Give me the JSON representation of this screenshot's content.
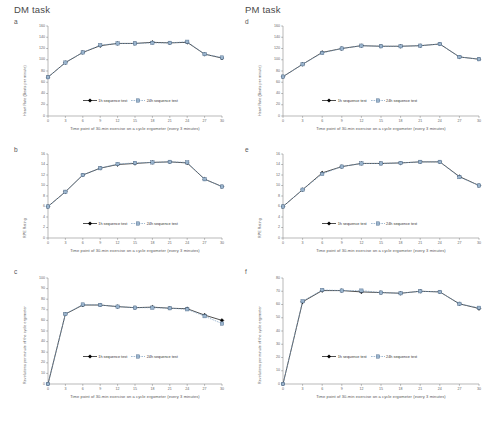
{
  "figure": {
    "columns": [
      {
        "title": "DM task",
        "id": "dm"
      },
      {
        "title": "PM task",
        "id": "pm"
      }
    ],
    "legend": {
      "series1": "1h sequence test",
      "series2": "24h sequence test",
      "color1": "#000000",
      "color2": "#7d9fc0"
    },
    "xlabel": "Time point of 30-min exercise on a cycle ergometer (every 3 minutes)"
  },
  "chart_data": [
    {
      "type": "line",
      "panel": "a",
      "column": "DM task",
      "title": "",
      "xlabel": "Time point of 30-min exercise on a cycle ergometer (every 3 minutes)",
      "ylabel": "Heart Rate (Beats per minute)",
      "x": [
        0,
        3,
        6,
        9,
        12,
        15,
        18,
        21,
        24,
        27,
        30
      ],
      "xticks": [
        0,
        3,
        6,
        9,
        12,
        15,
        18,
        21,
        24,
        27,
        30
      ],
      "yticks": [
        0,
        20,
        40,
        60,
        80,
        100,
        120,
        140,
        160
      ],
      "ylim": [
        0,
        160
      ],
      "xlim": [
        0,
        30
      ],
      "grid": false,
      "legend_position": "lower-center",
      "series": [
        {
          "name": "1h sequence test",
          "values": [
            69,
            95,
            113,
            125,
            129,
            129,
            131,
            130,
            131,
            110,
            103
          ]
        },
        {
          "name": "24h sequence test",
          "values": [
            69,
            95,
            113,
            126,
            129,
            129,
            130,
            130,
            132,
            110,
            104
          ]
        }
      ]
    },
    {
      "type": "line",
      "panel": "b",
      "column": "DM task",
      "title": "",
      "xlabel": "Time point of 30-min exercise on a cycle ergometer (every 3 minutes)",
      "ylabel": "RPE Rating",
      "x": [
        0,
        3,
        6,
        9,
        12,
        15,
        18,
        21,
        24,
        27,
        30
      ],
      "xticks": [
        0,
        3,
        6,
        9,
        12,
        15,
        18,
        21,
        24,
        27,
        30
      ],
      "yticks": [
        0,
        2,
        4,
        6,
        8,
        10,
        12,
        14,
        16
      ],
      "ylim": [
        0,
        16
      ],
      "xlim": [
        0,
        30
      ],
      "grid": false,
      "legend_position": "lower-center",
      "series": [
        {
          "name": "1h sequence test",
          "values": [
            6.0,
            8.8,
            12.0,
            13.3,
            14.0,
            14.2,
            14.4,
            14.5,
            14.3,
            11.2,
            9.8
          ]
        },
        {
          "name": "24h sequence test",
          "values": [
            6.0,
            8.8,
            12.0,
            13.3,
            14.1,
            14.3,
            14.4,
            14.5,
            14.4,
            11.2,
            9.8
          ]
        }
      ]
    },
    {
      "type": "line",
      "panel": "c",
      "column": "DM task",
      "title": "",
      "xlabel": "Time point of 30-min exercise on a cycle ergometer (every 3 minutes)",
      "ylabel": "Revolutions per minute of the cycle ergometer",
      "x": [
        0,
        3,
        6,
        9,
        12,
        15,
        18,
        21,
        24,
        27,
        30
      ],
      "xticks": [
        0,
        3,
        6,
        9,
        12,
        15,
        18,
        21,
        24,
        27,
        30
      ],
      "yticks": [
        0,
        10,
        20,
        30,
        40,
        50,
        60,
        70,
        80,
        90,
        100
      ],
      "ylim": [
        0,
        100
      ],
      "xlim": [
        0,
        30
      ],
      "grid": false,
      "legend_position": "lower-center",
      "series": [
        {
          "name": "1h sequence test",
          "values": [
            0,
            66,
            74.5,
            74.5,
            73,
            72,
            72.5,
            71.5,
            71,
            65,
            60
          ]
        },
        {
          "name": "24h sequence test",
          "values": [
            0,
            66,
            75,
            74.5,
            73,
            72,
            72,
            71.5,
            70.5,
            64,
            57
          ]
        }
      ]
    },
    {
      "type": "line",
      "panel": "d",
      "column": "PM task",
      "title": "",
      "xlabel": "Time point of 30-min exercise on a cycle ergometer (every 3 minutes)",
      "ylabel": "Heart Rate (Beats per minute)",
      "x": [
        0,
        3,
        6,
        9,
        12,
        15,
        18,
        21,
        24,
        27,
        30
      ],
      "xticks": [
        0,
        3,
        6,
        9,
        12,
        15,
        18,
        21,
        24,
        27,
        30
      ],
      "yticks": [
        0,
        20,
        40,
        60,
        80,
        100,
        120,
        140,
        160
      ],
      "ylim": [
        0,
        160
      ],
      "xlim": [
        0,
        30
      ],
      "grid": false,
      "legend_position": "lower-center",
      "series": [
        {
          "name": "1h sequence test",
          "values": [
            70,
            92,
            113,
            120,
            125,
            124,
            124,
            125,
            128,
            105,
            101
          ]
        },
        {
          "name": "24h sequence test",
          "values": [
            70,
            92,
            112,
            120,
            125,
            124,
            124,
            125,
            128,
            105,
            101
          ]
        }
      ]
    },
    {
      "type": "line",
      "panel": "e",
      "column": "PM task",
      "title": "",
      "xlabel": "Time point of 30-min exercise on a cycle ergometer (every 3 minutes)",
      "ylabel": "RPE Rating",
      "x": [
        0,
        3,
        6,
        9,
        12,
        15,
        18,
        21,
        24,
        27,
        30
      ],
      "xticks": [
        0,
        3,
        6,
        9,
        12,
        15,
        18,
        21,
        24,
        27,
        30
      ],
      "yticks": [
        0,
        2,
        4,
        6,
        8,
        10,
        12,
        14,
        16
      ],
      "ylim": [
        0,
        16
      ],
      "xlim": [
        0,
        30
      ],
      "grid": false,
      "legend_position": "lower-center",
      "series": [
        {
          "name": "1h sequence test",
          "values": [
            6.0,
            9.2,
            12.4,
            13.6,
            14.2,
            14.2,
            14.3,
            14.5,
            14.5,
            11.7,
            10.0
          ]
        },
        {
          "name": "24h sequence test",
          "values": [
            6.0,
            9.2,
            12.2,
            13.6,
            14.2,
            14.2,
            14.3,
            14.5,
            14.5,
            11.6,
            10.0
          ]
        }
      ]
    },
    {
      "type": "line",
      "panel": "f",
      "column": "PM task",
      "title": "",
      "xlabel": "Time point of 30-min exercise on a cycle ergometer (every 3 minutes)",
      "ylabel": "Revolutions per minute of the cycle ergometer",
      "x": [
        0,
        3,
        6,
        9,
        12,
        15,
        18,
        21,
        24,
        27,
        30
      ],
      "xticks": [
        0,
        3,
        6,
        9,
        12,
        15,
        18,
        21,
        24,
        27,
        30
      ],
      "yticks": [
        0,
        10,
        20,
        30,
        40,
        50,
        60,
        70,
        80
      ],
      "ylim": [
        0,
        80
      ],
      "xlim": [
        0,
        30
      ],
      "grid": false,
      "legend_position": "lower-center",
      "series": [
        {
          "name": "1h sequence test",
          "values": [
            0,
            62,
            70.5,
            70.5,
            69.5,
            69,
            68.5,
            70,
            69.5,
            60.5,
            57
          ]
        },
        {
          "name": "24h sequence test",
          "values": [
            0,
            62.5,
            71,
            70.5,
            70.5,
            69,
            68.5,
            70,
            69.5,
            60.5,
            57.5
          ]
        }
      ]
    }
  ]
}
